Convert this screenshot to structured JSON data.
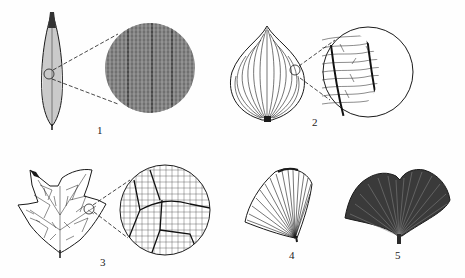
{
  "figure": {
    "type": "leaf-venation-diagram",
    "ink_color": "#1a1a1a",
    "background": "#fefefe",
    "panels": [
      {
        "id": 1,
        "label": "1",
        "leaf_shape": "linear-lanceolate",
        "venation": "parallel",
        "has_magnified_detail": true
      },
      {
        "id": 2,
        "label": "2",
        "leaf_shape": "ovate",
        "venation": "arcuate",
        "has_magnified_detail": true
      },
      {
        "id": 3,
        "label": "3",
        "leaf_shape": "lobed",
        "venation": "reticulate",
        "has_magnified_detail": true
      },
      {
        "id": 4,
        "label": "4",
        "leaf_shape": "fan",
        "venation": "dichotomous",
        "has_magnified_detail": false
      },
      {
        "id": 5,
        "label": "5",
        "leaf_shape": "bilobed-fan",
        "venation": "dichotomous",
        "has_magnified_detail": false
      }
    ]
  }
}
